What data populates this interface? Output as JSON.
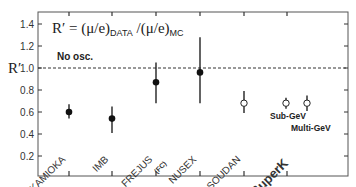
{
  "chart_data": {
    "type": "scatter",
    "title": "",
    "formula": {
      "lhs": "R′ = (μ/e)",
      "sub1": "DATA",
      "mid": " /(μ/e)",
      "sub2": "MC"
    },
    "ylabel": "R′",
    "xlabel": "",
    "ylim": [
      0,
      1.5
    ],
    "yticks": [
      0.2,
      0.4,
      0.6,
      0.8,
      1.0,
      1.2,
      1.4
    ],
    "ytick_labels": [
      "0.2",
      "0.4",
      "0.6",
      "0.8",
      "1.0",
      "1.2",
      "1.4"
    ],
    "grid": false,
    "reference_line": {
      "y": 1.0,
      "style": "dashed",
      "label": "No osc."
    },
    "categories": [
      "KAMIOKA",
      "IMB",
      "FREJUS",
      "NUSEX",
      "SOUDAN",
      "SuperK"
    ],
    "category_sublabels": {
      "FREJUS": "(FC)"
    },
    "points": [
      {
        "experiment": "KAMIOKA",
        "value": 0.6,
        "err_low": 0.54,
        "err_high": 0.67,
        "marker": "filled"
      },
      {
        "experiment": "IMB",
        "value": 0.54,
        "err_low": 0.41,
        "err_high": 0.65,
        "marker": "filled"
      },
      {
        "experiment": "FREJUS",
        "value": 0.87,
        "err_low": 0.68,
        "err_high": 1.05,
        "marker": "filled"
      },
      {
        "experiment": "NUSEX",
        "value": 0.96,
        "err_low": 0.68,
        "err_high": 1.28,
        "marker": "filled"
      },
      {
        "experiment": "SOUDAN",
        "value": 0.68,
        "err_low": 0.59,
        "err_high": 0.79,
        "marker": "open"
      },
      {
        "experiment": "SuperK",
        "label": "Sub-GeV",
        "value": 0.68,
        "err_low": 0.63,
        "err_high": 0.73,
        "marker": "open"
      },
      {
        "experiment": "SuperK",
        "label": "Multi-GeV",
        "value": 0.68,
        "err_low": 0.61,
        "err_high": 0.75,
        "marker": "open"
      }
    ],
    "point_annotations": [
      "Sub-GeV",
      "Multi-GeV"
    ]
  }
}
